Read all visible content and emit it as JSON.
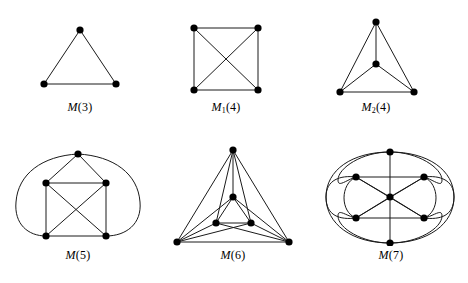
{
  "figure": {
    "width": 468,
    "height": 283,
    "background_color": "#ffffff",
    "stroke_color": "#1a1a1a",
    "vertex_color": "#000000",
    "vertex_radius": 3.6,
    "edge_width": 1.0
  },
  "graphs": [
    {
      "id": "m3",
      "label_symbol": "M",
      "label_subscript": "",
      "label_argument": "(3)",
      "label_text": "M(3)",
      "vertex_count": 3,
      "edge_count": 3,
      "origin": [
        22,
        12
      ],
      "size": [
        116,
        108
      ],
      "label_top": 88,
      "vertices": [
        {
          "name": "apex",
          "x": 58,
          "y": 18
        },
        {
          "name": "bottom-left",
          "x": 22,
          "y": 72
        },
        {
          "name": "bottom-right",
          "x": 94,
          "y": 72
        }
      ],
      "edges": [
        {
          "from": 0,
          "to": 1,
          "type": "line"
        },
        {
          "from": 0,
          "to": 2,
          "type": "line"
        },
        {
          "from": 1,
          "to": 2,
          "type": "line"
        }
      ]
    },
    {
      "id": "m1-4",
      "label_symbol": "M",
      "label_subscript": "1",
      "label_argument": "(4)",
      "label_text": "M1(4)",
      "vertex_count": 4,
      "edge_count": 6,
      "origin": [
        168,
        12
      ],
      "size": [
        116,
        108
      ],
      "label_top": 88,
      "vertices": [
        {
          "name": "top-left",
          "x": 26,
          "y": 16
        },
        {
          "name": "top-right",
          "x": 90,
          "y": 16
        },
        {
          "name": "bottom-left",
          "x": 26,
          "y": 78
        },
        {
          "name": "bottom-right",
          "x": 90,
          "y": 78
        }
      ],
      "edges": [
        {
          "from": 0,
          "to": 1,
          "type": "line"
        },
        {
          "from": 0,
          "to": 2,
          "type": "line"
        },
        {
          "from": 1,
          "to": 3,
          "type": "line"
        },
        {
          "from": 2,
          "to": 3,
          "type": "line"
        },
        {
          "from": 0,
          "to": 3,
          "type": "line"
        },
        {
          "from": 1,
          "to": 2,
          "type": "line"
        }
      ]
    },
    {
      "id": "m2-4",
      "label_symbol": "M",
      "label_subscript": "2",
      "label_argument": "(4)",
      "label_text": "M2(4)",
      "vertex_count": 4,
      "edge_count": 6,
      "origin": [
        318,
        12
      ],
      "size": [
        116,
        108
      ],
      "label_top": 88,
      "vertices": [
        {
          "name": "apex",
          "x": 58,
          "y": 10
        },
        {
          "name": "center",
          "x": 58,
          "y": 52
        },
        {
          "name": "bottom-left",
          "x": 22,
          "y": 80
        },
        {
          "name": "bottom-right",
          "x": 96,
          "y": 80
        }
      ],
      "edges": [
        {
          "from": 0,
          "to": 2,
          "type": "line"
        },
        {
          "from": 0,
          "to": 3,
          "type": "line"
        },
        {
          "from": 2,
          "to": 3,
          "type": "line"
        },
        {
          "from": 0,
          "to": 1,
          "type": "line"
        },
        {
          "from": 1,
          "to": 2,
          "type": "line"
        },
        {
          "from": 1,
          "to": 3,
          "type": "line"
        }
      ]
    },
    {
      "id": "m5",
      "label_symbol": "M",
      "label_subscript": "",
      "label_argument": "(5)",
      "label_text": "M(5)",
      "vertex_count": 5,
      "edge_count": 10,
      "origin": [
        8,
        140
      ],
      "size": [
        140,
        120
      ],
      "label_top": 108,
      "vertices": [
        {
          "name": "apex",
          "x": 70,
          "y": 14
        },
        {
          "name": "upper-left",
          "x": 38,
          "y": 43
        },
        {
          "name": "upper-right",
          "x": 98,
          "y": 43
        },
        {
          "name": "lower-left",
          "x": 38,
          "y": 96
        },
        {
          "name": "lower-right",
          "x": 98,
          "y": 96
        }
      ],
      "edges": [
        {
          "from": 0,
          "to": 1,
          "type": "line"
        },
        {
          "from": 0,
          "to": 2,
          "type": "line"
        },
        {
          "from": 1,
          "to": 2,
          "type": "line"
        },
        {
          "from": 1,
          "to": 3,
          "type": "line"
        },
        {
          "from": 2,
          "to": 4,
          "type": "line"
        },
        {
          "from": 3,
          "to": 4,
          "type": "line"
        },
        {
          "from": 1,
          "to": 4,
          "type": "line"
        },
        {
          "from": 2,
          "to": 3,
          "type": "line"
        },
        {
          "from": 0,
          "to": 3,
          "type": "curve-left"
        },
        {
          "from": 0,
          "to": 4,
          "type": "curve-right"
        }
      ]
    },
    {
      "id": "m6",
      "label_symbol": "M",
      "label_subscript": "",
      "label_argument": "(6)",
      "label_text": "M(6)",
      "vertex_count": 6,
      "edge_count": 15,
      "origin": [
        163,
        140
      ],
      "size": [
        140,
        120
      ],
      "label_top": 108,
      "vertices": [
        {
          "name": "outer-apex",
          "x": 70,
          "y": 10
        },
        {
          "name": "outer-bottom-left",
          "x": 14,
          "y": 102
        },
        {
          "name": "outer-bottom-right",
          "x": 126,
          "y": 102
        },
        {
          "name": "inner-apex",
          "x": 70,
          "y": 57
        },
        {
          "name": "inner-bottom-left",
          "x": 53,
          "y": 83
        },
        {
          "name": "inner-bottom-right",
          "x": 88,
          "y": 83
        }
      ],
      "edges": [
        {
          "from": 0,
          "to": 1,
          "type": "line"
        },
        {
          "from": 0,
          "to": 2,
          "type": "line"
        },
        {
          "from": 1,
          "to": 2,
          "type": "line"
        },
        {
          "from": 3,
          "to": 4,
          "type": "line"
        },
        {
          "from": 3,
          "to": 5,
          "type": "line"
        },
        {
          "from": 4,
          "to": 5,
          "type": "line"
        },
        {
          "from": 0,
          "to": 3,
          "type": "line"
        },
        {
          "from": 0,
          "to": 4,
          "type": "line"
        },
        {
          "from": 0,
          "to": 5,
          "type": "line"
        },
        {
          "from": 1,
          "to": 3,
          "type": "line"
        },
        {
          "from": 1,
          "to": 4,
          "type": "line"
        },
        {
          "from": 1,
          "to": 5,
          "type": "line"
        },
        {
          "from": 2,
          "to": 3,
          "type": "line"
        },
        {
          "from": 2,
          "to": 4,
          "type": "line"
        },
        {
          "from": 2,
          "to": 5,
          "type": "line"
        }
      ]
    },
    {
      "id": "m7",
      "label_symbol": "M",
      "label_subscript": "",
      "label_argument": "(7)",
      "label_text": "M(7)",
      "vertex_count": 7,
      "edge_count": 21,
      "origin": [
        318,
        140
      ],
      "size": [
        146,
        120
      ],
      "label_top": 108,
      "vertices": [
        {
          "name": "top",
          "x": 72,
          "y": 12
        },
        {
          "name": "upper-left",
          "x": 38,
          "y": 37
        },
        {
          "name": "upper-right",
          "x": 106,
          "y": 37
        },
        {
          "name": "center",
          "x": 72,
          "y": 57
        },
        {
          "name": "lower-left",
          "x": 38,
          "y": 78
        },
        {
          "name": "lower-right",
          "x": 106,
          "y": 78
        },
        {
          "name": "bottom",
          "x": 72,
          "y": 103
        }
      ],
      "edges": [
        {
          "from": 1,
          "to": 2,
          "type": "line"
        },
        {
          "from": 4,
          "to": 5,
          "type": "line"
        },
        {
          "from": 0,
          "to": 6,
          "type": "line"
        },
        {
          "from": 1,
          "to": 3,
          "type": "line"
        },
        {
          "from": 2,
          "to": 3,
          "type": "line"
        },
        {
          "from": 4,
          "to": 3,
          "type": "line"
        },
        {
          "from": 5,
          "to": 3,
          "type": "line"
        },
        {
          "from": 0,
          "to": 3,
          "type": "line"
        },
        {
          "from": 6,
          "to": 3,
          "type": "line"
        },
        {
          "from": 1,
          "to": 5,
          "type": "line"
        },
        {
          "from": 2,
          "to": 4,
          "type": "line"
        },
        {
          "from": 0,
          "to": 1,
          "type": "arc-outer-left"
        },
        {
          "from": 0,
          "to": 2,
          "type": "arc-outer-right"
        },
        {
          "from": 1,
          "to": 4,
          "type": "arc-outer-left"
        },
        {
          "from": 2,
          "to": 5,
          "type": "arc-outer-right"
        },
        {
          "from": 4,
          "to": 6,
          "type": "arc-outer-left"
        },
        {
          "from": 5,
          "to": 6,
          "type": "arc-outer-right"
        },
        {
          "from": 0,
          "to": 4,
          "type": "arc-wide-left"
        },
        {
          "from": 0,
          "to": 5,
          "type": "arc-wide-right"
        },
        {
          "from": 1,
          "to": 6,
          "type": "arc-wide-left"
        },
        {
          "from": 2,
          "to": 6,
          "type": "arc-wide-right"
        }
      ]
    }
  ]
}
